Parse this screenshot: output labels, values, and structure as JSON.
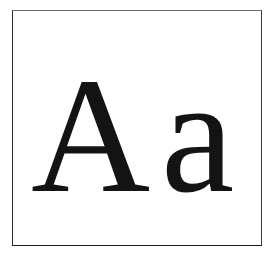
{
  "document": {
    "kind": "font-specimen",
    "background_color": "#ffffff"
  },
  "frame": {
    "border_color": "#2b2b2b",
    "fill_color": "#ffffff",
    "border_width_px": 1
  },
  "specimen": {
    "glyph_color": "#111111",
    "typeface_style": "serif",
    "glyphs": [
      {
        "character": "A",
        "case": "uppercase",
        "name": "latin-capital-letter-a"
      },
      {
        "character": "a",
        "case": "lowercase",
        "name": "latin-small-letter-a"
      }
    ]
  }
}
